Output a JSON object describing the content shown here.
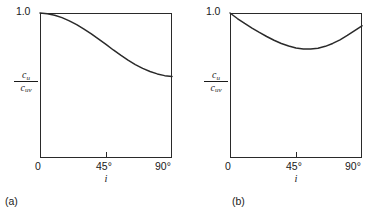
{
  "figure": {
    "background_color": "#ffffff",
    "line_color": "#2a2a2a",
    "panels": [
      {
        "caption": "(a)",
        "ylabel_numerator": "c",
        "ylabel_numerator_sub": "u",
        "ylabel_denominator": "c",
        "ylabel_denominator_sub": "uv",
        "ytop_label": "1.0",
        "xlabel": "i",
        "xticks": [
          "0",
          "45°",
          "90°"
        ]
      },
      {
        "caption": "(b)",
        "ylabel_numerator": "c",
        "ylabel_numerator_sub": "u",
        "ylabel_denominator": "c",
        "ylabel_denominator_sub": "uv",
        "ytop_label": "1.0",
        "xlabel": "i",
        "xticks": [
          "0",
          "45°",
          "90°"
        ]
      }
    ]
  },
  "chart_data": [
    {
      "type": "line",
      "title": "(a)",
      "xlabel": "i",
      "ylabel": "c_u / c_uv",
      "xlim": [
        0,
        90
      ],
      "ylim": [
        0,
        1.0
      ],
      "xticks": [
        0,
        45,
        90
      ],
      "xticklabels": [
        "0",
        "45°",
        "90°"
      ],
      "yticks": [
        1.0
      ],
      "yticklabels": [
        "1.0"
      ],
      "grid": false,
      "legend": "none",
      "x": [
        0,
        5,
        10,
        15,
        20,
        25,
        30,
        35,
        40,
        45,
        50,
        55,
        60,
        65,
        70,
        75,
        80,
        85,
        90
      ],
      "y": [
        1.0,
        0.995,
        0.985,
        0.968,
        0.946,
        0.92,
        0.889,
        0.856,
        0.82,
        0.783,
        0.745,
        0.709,
        0.675,
        0.644,
        0.618,
        0.597,
        0.58,
        0.568,
        0.562
      ]
    },
    {
      "type": "line",
      "title": "(b)",
      "xlabel": "i",
      "ylabel": "c_u / c_uv",
      "xlim": [
        0,
        90
      ],
      "ylim": [
        0,
        1.0
      ],
      "xticks": [
        0,
        45,
        90
      ],
      "xticklabels": [
        "0",
        "45°",
        "90°"
      ],
      "yticks": [
        1.0
      ],
      "yticklabels": [
        "1.0"
      ],
      "grid": false,
      "legend": "none",
      "x": [
        0,
        5,
        10,
        15,
        20,
        25,
        30,
        35,
        40,
        45,
        50,
        55,
        60,
        65,
        70,
        75,
        80,
        85,
        90
      ],
      "y": [
        1.0,
        0.962,
        0.928,
        0.896,
        0.866,
        0.838,
        0.812,
        0.79,
        0.772,
        0.759,
        0.752,
        0.751,
        0.757,
        0.77,
        0.79,
        0.815,
        0.845,
        0.878,
        0.912
      ]
    }
  ]
}
